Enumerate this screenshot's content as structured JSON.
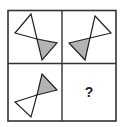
{
  "puzzle": {
    "grid": {
      "rows": 2,
      "cols": 2,
      "border_color": "#333333"
    },
    "colors": {
      "fill_gray": "#b3b3b3",
      "fill_white": "#ffffff",
      "stroke": "#222222"
    },
    "cells": [
      {
        "position": "top-left",
        "white_triangle": "31,14 15,33 37,39",
        "gray_triangle": "37,39 57,43 42,60"
      },
      {
        "position": "top-right",
        "white_triangle": "95,16 111,33 90,38",
        "gray_triangle": "90,38 69,43 85,60"
      },
      {
        "position": "bottom-left",
        "gray_triangle": "42,74 57,90 37,95",
        "white_triangle": "37,95 15,102 31,117"
      },
      {
        "position": "bottom-right",
        "question_mark": "?"
      }
    ]
  }
}
